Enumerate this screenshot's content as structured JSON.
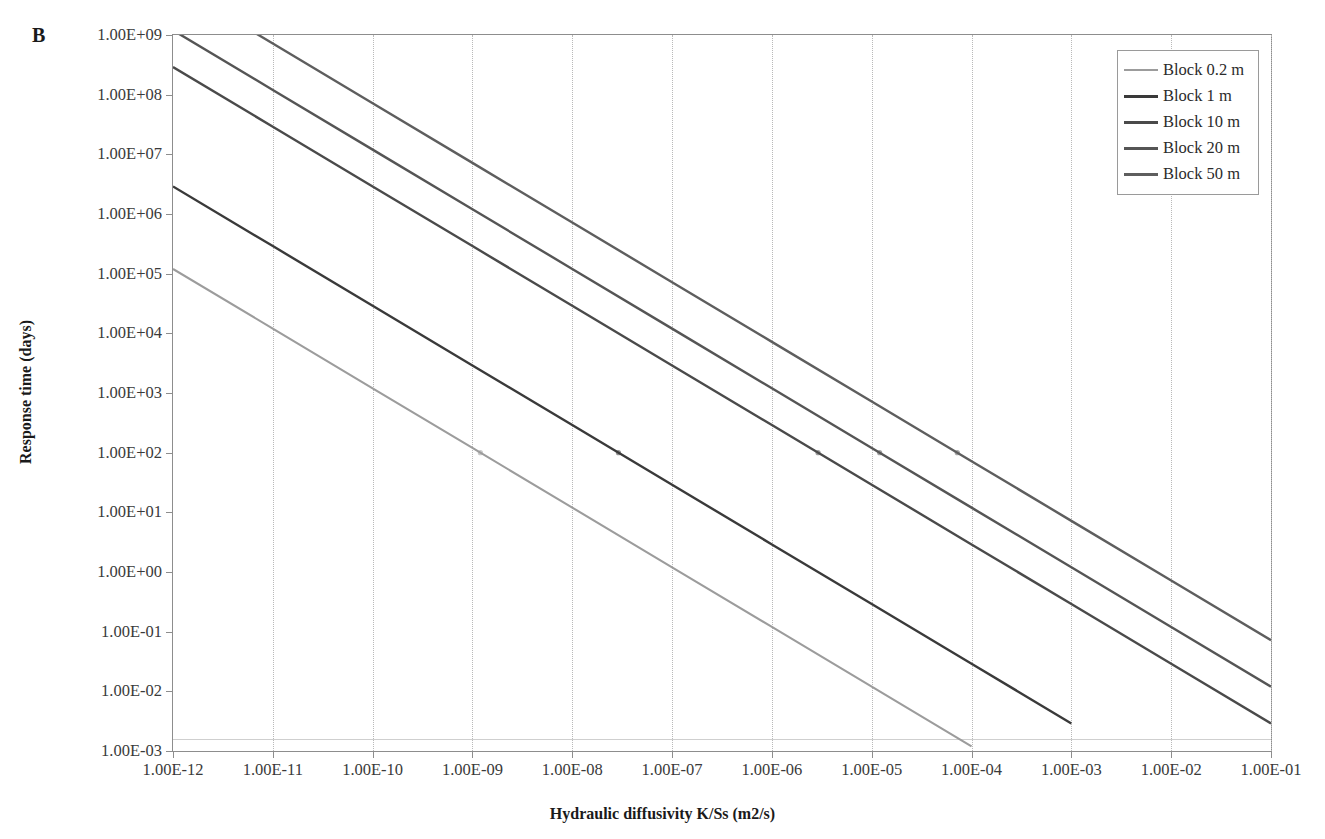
{
  "panel_label": "B",
  "axes": {
    "x_title": "Hydraulic diffusivity K/Ss (m2/s)",
    "y_title": "Response time (days)",
    "x_ticks": [
      "1.00E-12",
      "1.00E-11",
      "1.00E-10",
      "1.00E-09",
      "1.00E-08",
      "1.00E-07",
      "1.00E-06",
      "1.00E-05",
      "1.00E-04",
      "1.00E-03",
      "1.00E-02",
      "1.00E-01"
    ],
    "y_ticks": [
      "1.00E+09",
      "1.00E+08",
      "1.00E+07",
      "1.00E+06",
      "1.00E+05",
      "1.00E+04",
      "1.00E+03",
      "1.00E+02",
      "1.00E+01",
      "1.00E+00",
      "1.00E-01",
      "1.00E-02",
      "1.00E-03"
    ]
  },
  "legend": {
    "position": "top-right",
    "items": [
      {
        "label": "Block 0.2 m",
        "color": "#9c9c9c"
      },
      {
        "label": "Block 1 m",
        "color": "#3a3a3a"
      },
      {
        "label": "Block 10 m",
        "color": "#4a4a4a"
      },
      {
        "label": "Block 20 m",
        "color": "#555555"
      },
      {
        "label": "Block 50 m",
        "color": "#5e5e5e"
      }
    ]
  },
  "chart_data": {
    "type": "line",
    "title": "B",
    "xlabel": "Hydraulic diffusivity K/Ss (m2/s)",
    "ylabel": "Response time (days)",
    "xscale": "log",
    "yscale": "log",
    "xlim": [
      1e-12,
      0.1
    ],
    "ylim": [
      0.001,
      1000000000.0
    ],
    "grid": "vertical-dotted",
    "x": [
      1e-12,
      1e-11,
      1e-10,
      1e-09,
      1e-08,
      1e-07,
      1e-06,
      1e-05,
      0.0001,
      0.001,
      0.01,
      0.1
    ],
    "series": [
      {
        "name": "Block 0.2 m",
        "color": "#9c9c9c",
        "values": [
          120000.0,
          12000.0,
          1200.0,
          120.0,
          12.0,
          1.2,
          0.12,
          0.012,
          0.0012,
          null,
          null,
          null
        ]
      },
      {
        "name": "Block 1 m",
        "color": "#3a3a3a",
        "values": [
          2900000.0,
          290000.0,
          29000.0,
          2900.0,
          290.0,
          29.0,
          2.9,
          0.29,
          0.029,
          0.0029,
          null,
          null
        ]
      },
      {
        "name": "Block 10 m",
        "color": "#4a4a4a",
        "values": [
          290000000.0,
          29000000.0,
          2900000.0,
          290000.0,
          29000.0,
          2900.0,
          290.0,
          29.0,
          2.9,
          0.29,
          0.029,
          0.0029
        ]
      },
      {
        "name": "Block 20 m",
        "color": "#555555",
        "values": [
          1200000000.0,
          120000000.0,
          12000000.0,
          1200000.0,
          120000.0,
          12000.0,
          1200.0,
          120.0,
          12.0,
          1.2,
          0.12,
          0.012
        ]
      },
      {
        "name": "Block 50 m",
        "color": "#5e5e5e",
        "values": [
          7200000000.0,
          720000000.0,
          72000000.0,
          7200000.0,
          720000.0,
          72000.0,
          7200.0,
          720.0,
          72.0,
          7.2,
          0.72,
          0.072
        ]
      }
    ],
    "markers": {
      "note": "small point markers near 1.00E+02 days on each series",
      "y": 100
    }
  }
}
